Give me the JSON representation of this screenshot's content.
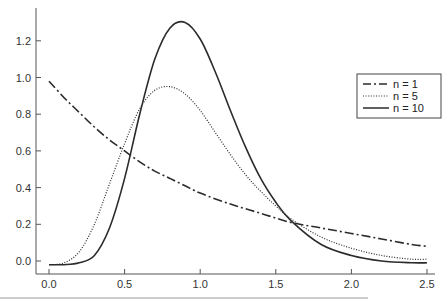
{
  "chart_data": {
    "type": "line",
    "title": "",
    "xlabel": "",
    "ylabel": "",
    "xlim": [
      -0.05,
      2.55
    ],
    "ylim": [
      -0.06,
      1.38
    ],
    "grid": false,
    "legend_position": "right, upper-middle",
    "x_ticks": [
      "0.0",
      "0.5",
      "1.0",
      "1.5",
      "2.0",
      "2.5"
    ],
    "y_ticks": [
      "0.0",
      "0.2",
      "0.4",
      "0.6",
      "0.8",
      "1.0",
      "1.2"
    ],
    "legend": [
      "n = 1",
      "n = 5",
      "n = 10"
    ],
    "series": [
      {
        "name": "n = 1",
        "style": "dash-dot",
        "x": [
          0.0,
          0.1,
          0.2,
          0.3,
          0.4,
          0.5,
          0.6,
          0.7,
          0.8,
          0.9,
          1.0,
          1.2,
          1.4,
          1.6,
          1.8,
          2.0,
          2.2,
          2.4,
          2.5
        ],
        "y": [
          0.98,
          0.89,
          0.81,
          0.73,
          0.66,
          0.6,
          0.54,
          0.49,
          0.45,
          0.41,
          0.37,
          0.31,
          0.26,
          0.21,
          0.18,
          0.15,
          0.12,
          0.09,
          0.08
        ]
      },
      {
        "name": "n = 5",
        "style": "dotted",
        "x": [
          0.0,
          0.1,
          0.2,
          0.3,
          0.4,
          0.5,
          0.6,
          0.7,
          0.8,
          0.9,
          1.0,
          1.1,
          1.2,
          1.3,
          1.4,
          1.5,
          1.6,
          1.8,
          2.0,
          2.2,
          2.4,
          2.5
        ],
        "y": [
          -0.02,
          -0.01,
          0.05,
          0.2,
          0.42,
          0.64,
          0.83,
          0.93,
          0.95,
          0.91,
          0.82,
          0.7,
          0.58,
          0.47,
          0.38,
          0.3,
          0.23,
          0.13,
          0.07,
          0.03,
          0.01,
          0.01
        ]
      },
      {
        "name": "n = 10",
        "style": "solid",
        "x": [
          0.0,
          0.1,
          0.2,
          0.3,
          0.4,
          0.5,
          0.6,
          0.7,
          0.8,
          0.9,
          1.0,
          1.1,
          1.2,
          1.3,
          1.4,
          1.5,
          1.6,
          1.8,
          2.0,
          2.2,
          2.4,
          2.5
        ],
        "y": [
          -0.02,
          -0.02,
          -0.01,
          0.03,
          0.18,
          0.45,
          0.8,
          1.1,
          1.27,
          1.3,
          1.21,
          1.03,
          0.82,
          0.62,
          0.45,
          0.32,
          0.22,
          0.09,
          0.03,
          0.0,
          -0.01,
          -0.01
        ]
      }
    ]
  },
  "colors": {
    "axis": "#555555",
    "line": "#2b2b2b",
    "rule": "#9a9a9a"
  }
}
